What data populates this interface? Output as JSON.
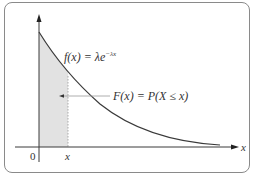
{
  "diagram": {
    "pdf_label": "f(x) = λe",
    "pdf_exponent": "−λx",
    "cdf_label": "F(x) = P(X ≤ x)",
    "x_axis_label": "x",
    "origin_label": "0",
    "x_marker_label": "x",
    "caption": "",
    "colors": {
      "curve": "#3a3a3a",
      "shade": "#e2e2e2",
      "axis": "#3a3a3a",
      "frame": "#8a8a8a",
      "arrow": "#888888"
    }
  }
}
